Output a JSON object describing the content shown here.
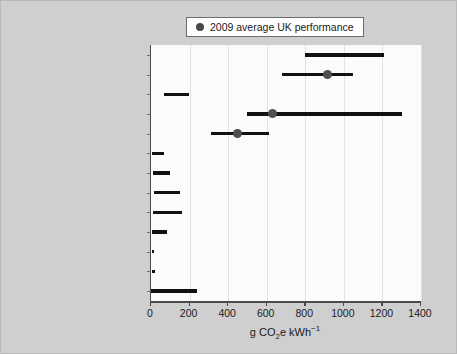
{
  "legend": {
    "marker_icon": "filled-circle-icon",
    "label": "2009 average UK performance",
    "marker_color": "#4e4e4e"
  },
  "axis": {
    "x_title_prefix": "g CO",
    "x_title_sub": "2",
    "x_title_mid": "e kWh",
    "x_title_sup": "−1",
    "x_title_full": "g CO2e kWh-1",
    "x_ticks": [
      "0",
      "200",
      "400",
      "600",
      "800",
      "1000",
      "1200",
      "1400"
    ]
  },
  "chart_data": {
    "type": "bar",
    "title": "",
    "subtitle": "",
    "xlabel": "g CO2e kWh-1",
    "ylabel": "",
    "xlim": [
      0,
      1400
    ],
    "grid": true,
    "legend_position": "top-center",
    "orientation": "horizontal",
    "categories": [
      "lignite",
      "hard coal",
      "hard coal with CCS",
      "oil",
      "natural gas",
      "nuclear",
      "biomass",
      "PV solar",
      "concentrating solar",
      "geothermal",
      "onshore wind",
      "offshore wind",
      "hydro"
    ],
    "ranges": [
      {
        "category": "lignite",
        "low": 800,
        "high": 1210,
        "marker": null
      },
      {
        "category": "hard coal",
        "low": 680,
        "high": 1050,
        "marker": 915
      },
      {
        "category": "hard coal with CCS",
        "low": 65,
        "high": 195,
        "marker": null
      },
      {
        "category": "oil",
        "low": 500,
        "high": 1300,
        "marker": 630
      },
      {
        "category": "natural gas",
        "low": 310,
        "high": 610,
        "marker": 450
      },
      {
        "category": "nuclear",
        "low": 5,
        "high": 65,
        "marker": null
      },
      {
        "category": "biomass",
        "low": 10,
        "high": 100,
        "marker": null
      },
      {
        "category": "PV solar",
        "low": 15,
        "high": 150,
        "marker": null
      },
      {
        "category": "concentrating solar",
        "low": 10,
        "high": 160,
        "marker": null
      },
      {
        "category": "geothermal",
        "low": 5,
        "high": 85,
        "marker": null
      },
      {
        "category": "onshore wind",
        "low": 3,
        "high": 16,
        "marker": null
      },
      {
        "category": "offshore wind",
        "low": 3,
        "high": 19,
        "marker": null
      },
      {
        "category": "hydro",
        "low": 0,
        "high": 240,
        "marker": null
      }
    ]
  },
  "colors": {
    "figure_background": "#cfcfcf",
    "plot_background": "#fbfbfb",
    "bar": "#111111",
    "marker": "#4e4e4e",
    "gridline": "#e2e2e2",
    "axis": "#4a4a4a",
    "text": "#1a1a1a"
  }
}
